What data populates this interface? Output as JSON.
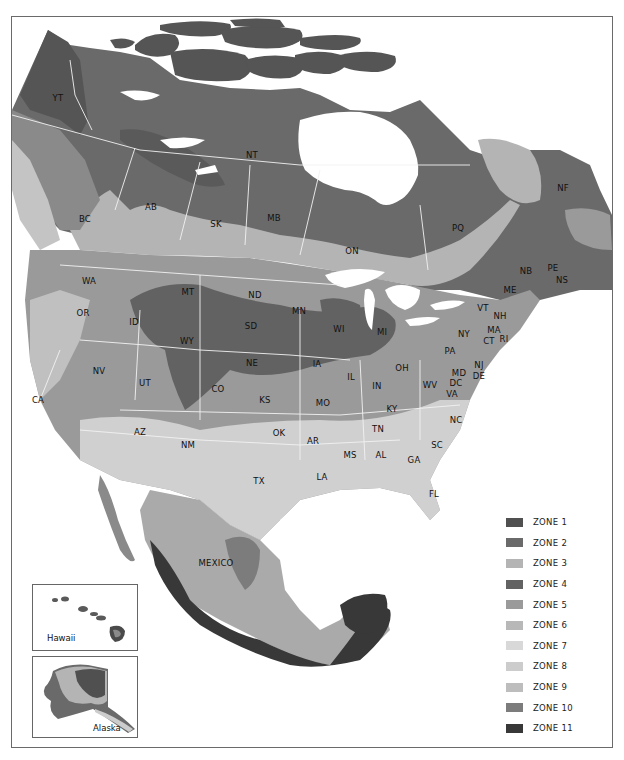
{
  "map": {
    "title": "North America Plant Hardiness Zones",
    "colors": {
      "zone1": "#505050",
      "zone2": "#6a6a6a",
      "zone3": "#b4b4b4",
      "zone4": "#626262",
      "zone5": "#9a9a9a",
      "zone6": "#b8b8b8",
      "zone7": "#d8d8d8",
      "zone8": "#cccccc",
      "zone9": "#bdbdbd",
      "zone10": "#7c7c7c",
      "zone11": "#383838",
      "water": "#ffffff",
      "border": "#f2f2f2"
    },
    "region_labels": [
      {
        "id": "YT",
        "text": "YT",
        "x": 58,
        "y": 98
      },
      {
        "id": "NT",
        "text": "NT",
        "x": 252,
        "y": 155
      },
      {
        "id": "NF",
        "text": "NF",
        "x": 563,
        "y": 188
      },
      {
        "id": "BC",
        "text": "BC",
        "x": 85,
        "y": 219
      },
      {
        "id": "AB",
        "text": "AB",
        "x": 151,
        "y": 207
      },
      {
        "id": "SK",
        "text": "SK",
        "x": 216,
        "y": 224
      },
      {
        "id": "MB",
        "text": "MB",
        "x": 274,
        "y": 218
      },
      {
        "id": "PQ",
        "text": "PQ",
        "x": 458,
        "y": 228
      },
      {
        "id": "ON",
        "text": "ON",
        "x": 352,
        "y": 251
      },
      {
        "id": "WA",
        "text": "WA",
        "x": 89,
        "y": 281
      },
      {
        "id": "PE",
        "text": "PE",
        "x": 553,
        "y": 268
      },
      {
        "id": "NB",
        "text": "NB",
        "x": 526,
        "y": 271
      },
      {
        "id": "NS",
        "text": "NS",
        "x": 562,
        "y": 280
      },
      {
        "id": "MT",
        "text": "MT",
        "x": 188,
        "y": 292
      },
      {
        "id": "ND",
        "text": "ND",
        "x": 255,
        "y": 295
      },
      {
        "id": "ME",
        "text": "ME",
        "x": 510,
        "y": 290
      },
      {
        "id": "OR",
        "text": "OR",
        "x": 83,
        "y": 313
      },
      {
        "id": "MN",
        "text": "MN",
        "x": 299,
        "y": 311
      },
      {
        "id": "ID",
        "text": "ID",
        "x": 134,
        "y": 322
      },
      {
        "id": "SD",
        "text": "SD",
        "x": 251,
        "y": 326
      },
      {
        "id": "WI",
        "text": "WI",
        "x": 339,
        "y": 329
      },
      {
        "id": "MI",
        "text": "MI",
        "x": 382,
        "y": 332
      },
      {
        "id": "VT",
        "text": "VT",
        "x": 483,
        "y": 308
      },
      {
        "id": "NH",
        "text": "NH",
        "x": 500,
        "y": 316
      },
      {
        "id": "NY",
        "text": "NY",
        "x": 464,
        "y": 334
      },
      {
        "id": "MA",
        "text": "MA",
        "x": 494,
        "y": 330
      },
      {
        "id": "WY",
        "text": "WY",
        "x": 187,
        "y": 341
      },
      {
        "id": "CT",
        "text": "CT",
        "x": 489,
        "y": 341
      },
      {
        "id": "RI",
        "text": "RI",
        "x": 504,
        "y": 339
      },
      {
        "id": "PA",
        "text": "PA",
        "x": 450,
        "y": 351
      },
      {
        "id": "NE",
        "text": "NE",
        "x": 252,
        "y": 363
      },
      {
        "id": "IA",
        "text": "IA",
        "x": 317,
        "y": 364
      },
      {
        "id": "NJ",
        "text": "NJ",
        "x": 479,
        "y": 365
      },
      {
        "id": "OH",
        "text": "OH",
        "x": 402,
        "y": 368
      },
      {
        "id": "NV",
        "text": "NV",
        "x": 99,
        "y": 371
      },
      {
        "id": "IL",
        "text": "IL",
        "x": 351,
        "y": 377
      },
      {
        "id": "MD",
        "text": "MD",
        "x": 459,
        "y": 373
      },
      {
        "id": "DE",
        "text": "DE",
        "x": 479,
        "y": 376
      },
      {
        "id": "UT",
        "text": "UT",
        "x": 145,
        "y": 383
      },
      {
        "id": "IN",
        "text": "IN",
        "x": 377,
        "y": 386
      },
      {
        "id": "DC",
        "text": "DC",
        "x": 456,
        "y": 383
      },
      {
        "id": "WV",
        "text": "WV",
        "x": 430,
        "y": 385
      },
      {
        "id": "CO",
        "text": "CO",
        "x": 218,
        "y": 389
      },
      {
        "id": "VA",
        "text": "VA",
        "x": 452,
        "y": 394
      },
      {
        "id": "CA",
        "text": "CA",
        "x": 38,
        "y": 400
      },
      {
        "id": "KS",
        "text": "KS",
        "x": 265,
        "y": 400
      },
      {
        "id": "MO",
        "text": "MO",
        "x": 323,
        "y": 403
      },
      {
        "id": "KY",
        "text": "KY",
        "x": 392,
        "y": 409
      },
      {
        "id": "NC",
        "text": "NC",
        "x": 456,
        "y": 420
      },
      {
        "id": "AZ",
        "text": "AZ",
        "x": 140,
        "y": 432
      },
      {
        "id": "OK",
        "text": "OK",
        "x": 279,
        "y": 433
      },
      {
        "id": "TN",
        "text": "TN",
        "x": 378,
        "y": 429
      },
      {
        "id": "AR",
        "text": "AR",
        "x": 313,
        "y": 441
      },
      {
        "id": "NM",
        "text": "NM",
        "x": 188,
        "y": 445
      },
      {
        "id": "SC",
        "text": "SC",
        "x": 437,
        "y": 445
      },
      {
        "id": "MS",
        "text": "MS",
        "x": 350,
        "y": 455
      },
      {
        "id": "AL",
        "text": "AL",
        "x": 381,
        "y": 455
      },
      {
        "id": "GA",
        "text": "GA",
        "x": 414,
        "y": 460
      },
      {
        "id": "LA",
        "text": "LA",
        "x": 322,
        "y": 477
      },
      {
        "id": "TX",
        "text": "TX",
        "x": 259,
        "y": 481
      },
      {
        "id": "FL",
        "text": "FL",
        "x": 434,
        "y": 494
      },
      {
        "id": "MEXICO",
        "text": "MEXICO",
        "x": 216,
        "y": 563
      }
    ],
    "insets": [
      {
        "id": "hawaii",
        "label": "Hawaii"
      },
      {
        "id": "alaska",
        "label": "Alaska"
      }
    ]
  },
  "legend": {
    "items": [
      {
        "label": "ZONE  1",
        "color": "#505050"
      },
      {
        "label": "ZONE  2",
        "color": "#6a6a6a"
      },
      {
        "label": "ZONE  3",
        "color": "#b4b4b4"
      },
      {
        "label": "ZONE  4",
        "color": "#626262"
      },
      {
        "label": "ZONE  5",
        "color": "#9a9a9a"
      },
      {
        "label": "ZONE  6",
        "color": "#b8b8b8"
      },
      {
        "label": "ZONE  7",
        "color": "#d8d8d8"
      },
      {
        "label": "ZONE  8",
        "color": "#cccccc"
      },
      {
        "label": "ZONE  9",
        "color": "#bdbdbd"
      },
      {
        "label": "ZONE 10",
        "color": "#7c7c7c"
      },
      {
        "label": "ZONE 11",
        "color": "#383838"
      }
    ]
  }
}
